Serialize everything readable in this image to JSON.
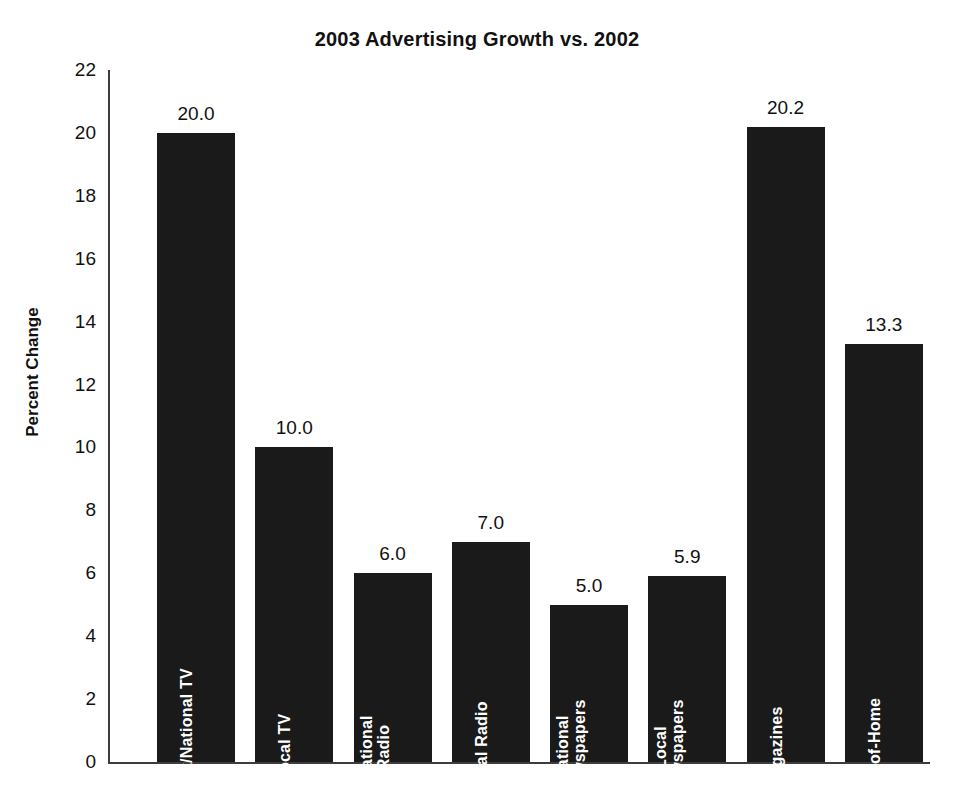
{
  "chart_data": {
    "type": "bar",
    "title": "2003 Advertising Growth vs. 2002",
    "xlabel": "",
    "ylabel": "Percent Change",
    "ylim": [
      0,
      22
    ],
    "ytick_step": 2,
    "grid": false,
    "legend": "none",
    "value_label_format": "one-decimal",
    "bar_color": "#1a1a1a",
    "background_color": "#ffffff",
    "axis_color": "#3d3d3d",
    "bar_label_color": "#ffffff",
    "categories": [
      "Network/National TV",
      "Local TV",
      "National Radio",
      "Local Radio",
      "National Newspapers",
      "Local Newspapers",
      "Magazines",
      "Out-of-Home"
    ],
    "category_label_lines": [
      "Network/National TV",
      "Local TV",
      "National\nRadio",
      "Local Radio",
      "National\nNewspapers",
      "Local\nNewspapers",
      "Magazines",
      "Out-of-Home"
    ],
    "values": [
      20.0,
      10.0,
      6.0,
      7.0,
      5.0,
      5.9,
      20.2,
      13.3
    ],
    "value_labels": [
      "20.0",
      "10.0",
      "6.0",
      "7.0",
      "5.0",
      "5.9",
      "20.2",
      "13.3"
    ],
    "yticks": [
      0,
      2,
      4,
      6,
      8,
      10,
      12,
      14,
      16,
      18,
      20,
      22
    ],
    "ytick_labels": [
      "0",
      "2",
      "4",
      "6",
      "8",
      "10",
      "12",
      "14",
      "16",
      "18",
      "20",
      "22"
    ]
  }
}
